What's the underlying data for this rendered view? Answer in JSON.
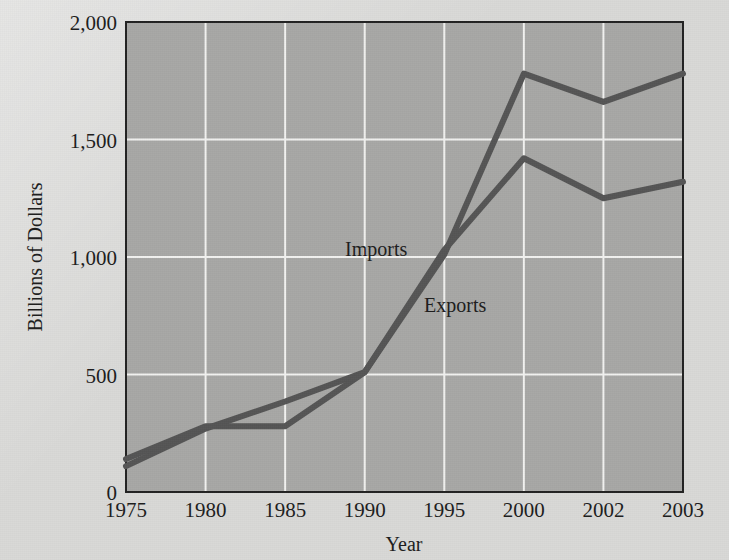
{
  "figure": {
    "background_color": "#d9d9d7",
    "plot_area_color": "#a8a8a6",
    "plot_border_color": "#222222",
    "gridline_color": "#f2f2f0",
    "line_color": "#555555"
  },
  "axes": {
    "x_title": "Year",
    "y_title": "Billions of Dollars",
    "x_ticks": [
      "1975",
      "1980",
      "1985",
      "1990",
      "1995",
      "2000",
      "2002",
      "2003"
    ],
    "y_ticks": [
      "0",
      "500",
      "1,000",
      "1,500",
      "2,000"
    ]
  },
  "annotations": {
    "imports_label": "Imports",
    "exports_label": "Exports"
  },
  "chart_data": {
    "type": "line",
    "title": "",
    "xlabel": "Year",
    "ylabel": "Billions of Dollars",
    "categories": [
      "1975",
      "1980",
      "1985",
      "1990",
      "1995",
      "2000",
      "2002",
      "2003"
    ],
    "ylim": [
      0,
      2000
    ],
    "y_ticks": [
      0,
      500,
      1000,
      1500,
      2000
    ],
    "grid": true,
    "legend": "inline-annotations",
    "series": [
      {
        "name": "Imports",
        "color": "#555555",
        "values": [
          110,
          270,
          385,
          510,
          1010,
          1780,
          1660,
          1780
        ]
      },
      {
        "name": "Exports",
        "color": "#555555",
        "values": [
          140,
          280,
          280,
          510,
          1030,
          1420,
          1250,
          1320
        ]
      }
    ]
  }
}
